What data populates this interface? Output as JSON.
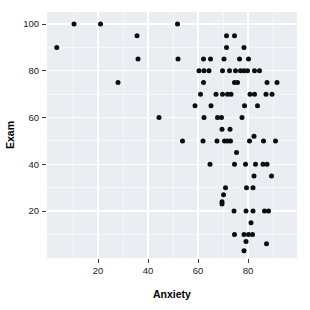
{
  "chart_data": {
    "type": "scatter",
    "title": "",
    "xlabel": "Anxiety",
    "ylabel": "Exam",
    "xlim": [
      0,
      100
    ],
    "ylim": [
      0,
      105
    ],
    "grid": true,
    "legend": null,
    "xticks": [
      20,
      40,
      60,
      80
    ],
    "xticklabels": [
      "20",
      "40",
      "60",
      "80"
    ],
    "yticks": [
      20,
      40,
      60,
      80,
      100
    ],
    "yticklabels": [
      "20",
      "40",
      "60",
      "80",
      "100"
    ],
    "x_minor_ticks": [
      10,
      30,
      50,
      70,
      90
    ],
    "y_minor_ticks": [
      10,
      30,
      50,
      70,
      90
    ],
    "point_color": "#0d0d0d",
    "panel_color": "#eaedf2",
    "gridline_color": "#ffffff",
    "n_points": 103,
    "points": [
      [
        10.4,
        100
      ],
      [
        21.0,
        100
      ],
      [
        51.8,
        100
      ],
      [
        3.5,
        90
      ],
      [
        35.6,
        95
      ],
      [
        71.4,
        95
      ],
      [
        74.6,
        95
      ],
      [
        71.4,
        90
      ],
      [
        78.4,
        90
      ],
      [
        36.0,
        85
      ],
      [
        52.0,
        85
      ],
      [
        62.2,
        85
      ],
      [
        65.0,
        85
      ],
      [
        70.4,
        85
      ],
      [
        76.6,
        85
      ],
      [
        80.2,
        85
      ],
      [
        60.4,
        80
      ],
      [
        62.4,
        80
      ],
      [
        64.4,
        80
      ],
      [
        69.8,
        80
      ],
      [
        72.6,
        80
      ],
      [
        75.0,
        80
      ],
      [
        77.0,
        80
      ],
      [
        78.4,
        80
      ],
      [
        79.8,
        80
      ],
      [
        82.6,
        80
      ],
      [
        84.6,
        80
      ],
      [
        28.0,
        75
      ],
      [
        62.2,
        75
      ],
      [
        74.6,
        75
      ],
      [
        75.8,
        75
      ],
      [
        87.6,
        75
      ],
      [
        91.6,
        75
      ],
      [
        61.0,
        70
      ],
      [
        67.2,
        70
      ],
      [
        69.8,
        70
      ],
      [
        71.8,
        70
      ],
      [
        73.2,
        70
      ],
      [
        80.8,
        70
      ],
      [
        82.6,
        70
      ],
      [
        87.2,
        70
      ],
      [
        89.6,
        70
      ],
      [
        58.8,
        65
      ],
      [
        65.2,
        65
      ],
      [
        78.6,
        65
      ],
      [
        83.8,
        65
      ],
      [
        44.4,
        60
      ],
      [
        62.4,
        60
      ],
      [
        67.8,
        60
      ],
      [
        69.4,
        60
      ],
      [
        77.6,
        60
      ],
      [
        69.6,
        55
      ],
      [
        72.8,
        55
      ],
      [
        53.8,
        50
      ],
      [
        62.0,
        50
      ],
      [
        67.6,
        50
      ],
      [
        70.6,
        50
      ],
      [
        71.8,
        50
      ],
      [
        73.0,
        50
      ],
      [
        80.6,
        50
      ],
      [
        82.4,
        52
      ],
      [
        86.2,
        50
      ],
      [
        91.0,
        50
      ],
      [
        75.4,
        45
      ],
      [
        64.8,
        40
      ],
      [
        74.6,
        40
      ],
      [
        79.0,
        40
      ],
      [
        83.0,
        40
      ],
      [
        86.0,
        40
      ],
      [
        87.6,
        40
      ],
      [
        82.4,
        35
      ],
      [
        89.4,
        35
      ],
      [
        71.0,
        30
      ],
      [
        79.4,
        30
      ],
      [
        82.0,
        30
      ],
      [
        70.2,
        27
      ],
      [
        69.6,
        24
      ],
      [
        69.6,
        23
      ],
      [
        74.4,
        20
      ],
      [
        79.2,
        20
      ],
      [
        82.0,
        20
      ],
      [
        86.6,
        20
      ],
      [
        88.2,
        20
      ],
      [
        81.2,
        15
      ],
      [
        74.6,
        10
      ],
      [
        78.4,
        10
      ],
      [
        80.2,
        10
      ],
      [
        81.8,
        10
      ],
      [
        79.2,
        7
      ],
      [
        87.4,
        6
      ],
      [
        78.4,
        3
      ]
    ]
  },
  "axes": {
    "x_title": "Anxiety",
    "y_title": "Exam"
  }
}
